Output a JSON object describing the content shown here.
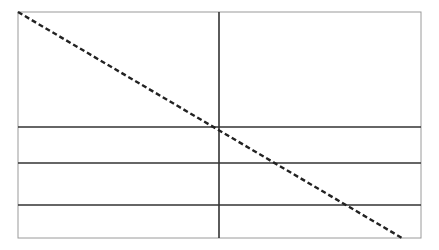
{
  "diagram": {
    "width": 439,
    "height": 250,
    "frame": {
      "x1": 18,
      "y1": 12,
      "x2": 421,
      "y2": 238,
      "stroke": "#9a9a9a",
      "stroke_width": 1
    },
    "vertical_lines": [
      {
        "x": 219,
        "y1": 12,
        "y2": 238,
        "stroke": "#333333",
        "stroke_width": 1.6
      }
    ],
    "horizontal_lines": [
      {
        "y": 127,
        "x1": 18,
        "x2": 421,
        "stroke": "#333333",
        "stroke_width": 1.6
      },
      {
        "y": 163,
        "x1": 18,
        "x2": 421,
        "stroke": "#333333",
        "stroke_width": 1.6
      },
      {
        "y": 205,
        "x1": 18,
        "x2": 421,
        "stroke": "#333333",
        "stroke_width": 1.6
      }
    ],
    "diagonal": {
      "x1": 18,
      "y1": 12,
      "x2": 402,
      "y2": 238,
      "stroke": "#222222",
      "stroke_width": 2.4,
      "dash": "5,3"
    }
  }
}
